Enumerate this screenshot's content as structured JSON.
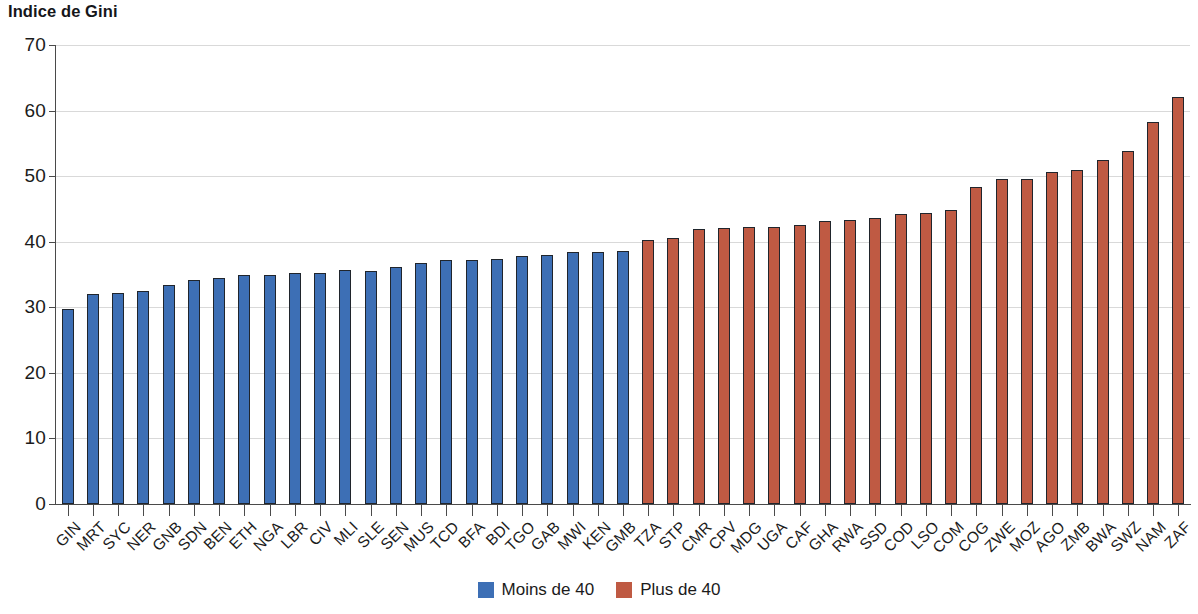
{
  "chart": {
    "title": "Indice de Gini"
  },
  "chart_data": {
    "type": "bar",
    "title": "Indice de Gini",
    "xlabel": "",
    "ylabel": "",
    "ylim": [
      0,
      70
    ],
    "yticks": [
      0,
      10,
      20,
      30,
      40,
      50,
      60,
      70
    ],
    "grid": true,
    "legend_position": "bottom-center",
    "threshold": 40,
    "colors": {
      "low": "#3d6fb5",
      "high": "#bf5a43",
      "gridline": "#d9d9d9",
      "axis": "#4a4a4a",
      "text": "#1b1b1b"
    },
    "legend": [
      {
        "label": "Moins de 40",
        "color": "#3d6fb5",
        "group": "low"
      },
      {
        "label": "Plus de 40",
        "color": "#bf5a43",
        "group": "high"
      }
    ],
    "categories": [
      "GIN",
      "MRT",
      "SYC",
      "NER",
      "GNB",
      "SDN",
      "BEN",
      "ETH",
      "NGA",
      "LBR",
      "CIV",
      "MLI",
      "SLE",
      "SEN",
      "MUS",
      "TCD",
      "BFA",
      "BDI",
      "TGO",
      "GAB",
      "MWI",
      "KEN",
      "GMB",
      "TZA",
      "STP",
      "CMR",
      "CPV",
      "MDG",
      "UGA",
      "CAF",
      "GHA",
      "RWA",
      "SSD",
      "COD",
      "LSO",
      "COM",
      "COG",
      "ZWE",
      "MOZ",
      "AGO",
      "ZMB",
      "BWA",
      "SWZ",
      "NAM",
      "ZAF"
    ],
    "values": [
      29.7,
      32.0,
      32.2,
      32.5,
      33.4,
      34.2,
      34.4,
      35.0,
      35.0,
      35.2,
      35.2,
      35.7,
      35.6,
      36.2,
      36.7,
      37.2,
      37.2,
      37.4,
      37.8,
      38.0,
      38.4,
      38.5,
      38.6,
      40.2,
      40.5,
      41.9,
      42.1,
      42.3,
      42.3,
      42.6,
      43.1,
      43.3,
      43.6,
      44.2,
      44.4,
      44.9,
      48.3,
      49.6,
      49.6,
      50.6,
      50.9,
      52.5,
      53.8,
      58.3,
      62.1
    ],
    "groups": [
      "low",
      "low",
      "low",
      "low",
      "low",
      "low",
      "low",
      "low",
      "low",
      "low",
      "low",
      "low",
      "low",
      "low",
      "low",
      "low",
      "low",
      "low",
      "low",
      "low",
      "low",
      "low",
      "low",
      "high",
      "high",
      "high",
      "high",
      "high",
      "high",
      "high",
      "high",
      "high",
      "high",
      "high",
      "high",
      "high",
      "high",
      "high",
      "high",
      "high",
      "high",
      "high",
      "high",
      "high",
      "high"
    ]
  }
}
